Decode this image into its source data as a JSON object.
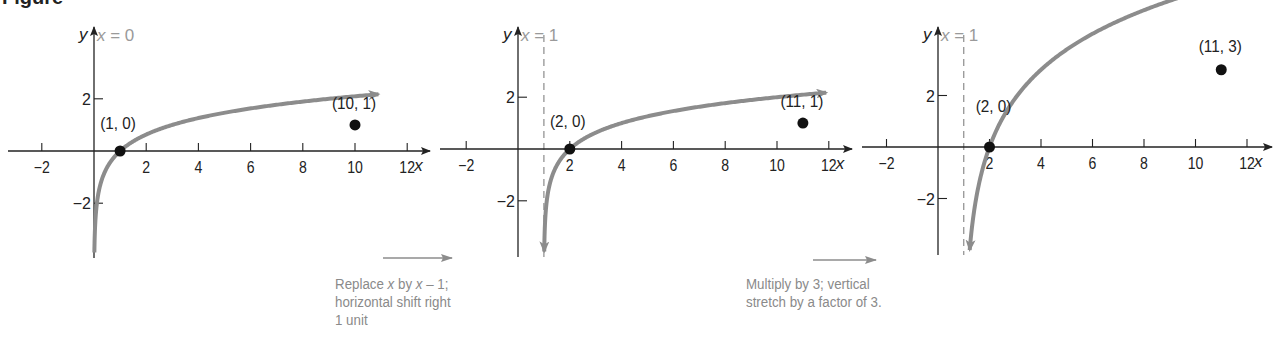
{
  "figure": {
    "heading_fragment": "Figure",
    "colors": {
      "axis": "#222222",
      "curve": "#8c8c8c",
      "point": "#111111",
      "asymptote": "#8c8c8c",
      "caption": "#8a8a8a",
      "asymptote_label": "#9a9a9a"
    }
  },
  "chart_data": [
    {
      "type": "line",
      "title": "",
      "function": "y = log_3(x)",
      "xlabel": "x",
      "ylabel": "y",
      "xlim": [
        -3,
        12.5
      ],
      "ylim": [
        -4.2,
        4.7
      ],
      "x_ticks": [
        -2,
        2,
        4,
        6,
        8,
        10,
        12
      ],
      "x_tick_labels": [
        "−2",
        "2",
        "4",
        "6",
        "8",
        "10",
        "12"
      ],
      "y_ticks": [
        2,
        -2
      ],
      "y_tick_labels": [
        "2",
        "−2"
      ],
      "asymptote": {
        "label": "x = 0",
        "x": 0,
        "style": "solid (y-axis)"
      },
      "points": [
        {
          "x": 1,
          "y": 0,
          "label": "(1, 0)"
        },
        {
          "x": 10,
          "y": 1,
          "label": "(10, 1)"
        }
      ],
      "grid": false
    },
    {
      "type": "line",
      "title": "",
      "function": "y = log_3(x - 1)",
      "xlabel": "x",
      "ylabel": "y",
      "xlim": [
        -3,
        12.5
      ],
      "ylim": [
        -4.2,
        4.7
      ],
      "x_ticks": [
        -2,
        2,
        4,
        6,
        8,
        10,
        12
      ],
      "x_tick_labels": [
        "−2",
        "2",
        "4",
        "6",
        "8",
        "10",
        "12"
      ],
      "y_ticks": [
        2,
        -2
      ],
      "y_tick_labels": [
        "2",
        "−2"
      ],
      "asymptote": {
        "label": "x = 1",
        "x": 1,
        "style": "dashed"
      },
      "points": [
        {
          "x": 2,
          "y": 0,
          "label": "(2, 0)"
        },
        {
          "x": 11,
          "y": 1,
          "label": "(11, 1)"
        }
      ],
      "grid": false
    },
    {
      "type": "line",
      "title": "",
      "function": "y = 3 log_3(x - 1)",
      "xlabel": "x",
      "ylabel": "y",
      "xlim": [
        -3,
        12.5
      ],
      "ylim": [
        -4.2,
        4.7
      ],
      "x_ticks": [
        -2,
        2,
        4,
        6,
        8,
        10,
        12
      ],
      "x_tick_labels": [
        "−2",
        "2",
        "4",
        "6",
        "8",
        "10",
        "12"
      ],
      "y_ticks": [
        2,
        -2
      ],
      "y_tick_labels": [
        "2",
        "−2"
      ],
      "asymptote": {
        "label": "x = 1",
        "x": 1,
        "style": "dashed"
      },
      "points": [
        {
          "x": 2,
          "y": 0,
          "label": "(2, 0)"
        },
        {
          "x": 11,
          "y": 3,
          "label": "(11, 3)"
        }
      ],
      "grid": false
    }
  ],
  "transitions": [
    {
      "caption_line1_a": "Replace ",
      "caption_line1_var1": "x",
      "caption_line1_b": " by ",
      "caption_line1_var2": "x",
      "caption_line1_c": " – 1;",
      "caption_line2": "horizontal shift right",
      "caption_line3": "1 unit"
    },
    {
      "caption_line1": "Multiply by 3; vertical",
      "caption_line2": "stretch by a factor of 3."
    }
  ]
}
